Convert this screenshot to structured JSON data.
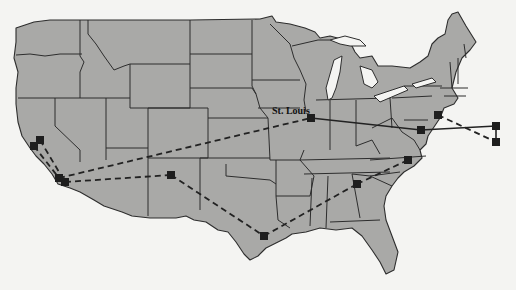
{
  "figure": {
    "colors": {
      "land": "#a9a9a7",
      "border": "#2d2d2d",
      "background": "#f4f4f2",
      "node": "#1e1e1e",
      "link": "#222222"
    }
  },
  "labels": {
    "st_louis": "St. Louis"
  },
  "nodes": [
    {
      "id": "sf1",
      "x": 34,
      "y": 146
    },
    {
      "id": "sf2",
      "x": 40,
      "y": 140
    },
    {
      "id": "la1",
      "x": 59,
      "y": 178
    },
    {
      "id": "la2",
      "x": 65,
      "y": 182
    },
    {
      "id": "southwest",
      "x": 171,
      "y": 175
    },
    {
      "id": "st_louis",
      "x": 311,
      "y": 118
    },
    {
      "id": "dc",
      "x": 421,
      "y": 130
    },
    {
      "id": "nj",
      "x": 438,
      "y": 115
    },
    {
      "id": "offshore1",
      "x": 496,
      "y": 126
    },
    {
      "id": "offshore2",
      "x": 496,
      "y": 142
    },
    {
      "id": "nc",
      "x": 408,
      "y": 160
    },
    {
      "id": "atlanta",
      "x": 357,
      "y": 184
    },
    {
      "id": "houston",
      "x": 264,
      "y": 236
    }
  ],
  "links": [
    {
      "from": "sf2",
      "to": "la2",
      "style": "dashed"
    },
    {
      "from": "sf1",
      "to": "la1",
      "style": "dashed"
    },
    {
      "from": "la1",
      "to": "st_louis",
      "style": "dashed"
    },
    {
      "from": "la2",
      "to": "southwest",
      "style": "dashed"
    },
    {
      "from": "southwest",
      "to": "houston",
      "style": "dashed"
    },
    {
      "from": "houston",
      "to": "atlanta",
      "style": "dashed"
    },
    {
      "from": "atlanta",
      "to": "nc",
      "style": "dashed"
    },
    {
      "from": "st_louis",
      "to": "dc",
      "style": "solid"
    },
    {
      "from": "dc",
      "to": "offshore1",
      "style": "solid"
    },
    {
      "from": "offshore1",
      "to": "offshore2",
      "style": "solid"
    },
    {
      "from": "nj",
      "to": "offshore2",
      "style": "dashed"
    }
  ]
}
